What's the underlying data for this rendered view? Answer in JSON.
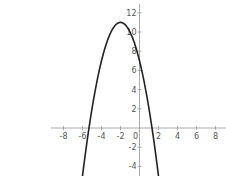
{
  "chart_data": {
    "type": "line",
    "title": "",
    "function": "y = -(x+2)^2 + 11",
    "xlabel": "",
    "ylabel": "",
    "xlim": [
      -9,
      9
    ],
    "ylim": [
      -5,
      13
    ],
    "x_ticks": [
      -8,
      -6,
      -4,
      -2,
      0,
      2,
      4,
      6,
      8
    ],
    "y_ticks": [
      -4,
      -2,
      2,
      4,
      6,
      8,
      10,
      12
    ],
    "grid": false,
    "legend": null,
    "series": [
      {
        "name": "parabola",
        "x": [
          -6,
          -5,
          -4,
          -3,
          -2,
          -1,
          0,
          1,
          2
        ],
        "y": [
          -5,
          2,
          7,
          10,
          11,
          10,
          7,
          2,
          -5
        ]
      }
    ],
    "vertex": [
      -2,
      11
    ],
    "y_intercept": 7,
    "roots": [
      -5.32,
      1.32
    ]
  }
}
